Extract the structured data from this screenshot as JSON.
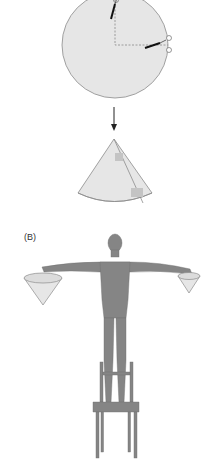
{
  "figure": {
    "panel_b_label": "(B)",
    "panels": [
      {
        "id": "A",
        "description": "Paper disc with quarter sector cut by scissors along dashed lines, arrow down to folded cone taped at seam"
      },
      {
        "id": "B",
        "description": "Person standing on chair with arms outstretched holding a large cone in right hand and small cone in left hand"
      }
    ]
  },
  "colors": {
    "paper": "#e6e6e6",
    "outline": "#8c8c8c",
    "figure": "#858585",
    "tape": "#c4c4c4",
    "arrow": "#222222"
  }
}
